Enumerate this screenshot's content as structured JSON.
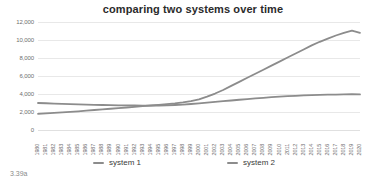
{
  "figure": {
    "caption": "3.39a"
  },
  "legend": {
    "position": "bottom",
    "items": [
      {
        "label": "system 1",
        "color": "#8c8c8c"
      },
      {
        "label": "system 2",
        "color": "#8c8c8c"
      }
    ]
  },
  "chart_data": {
    "type": "line",
    "title": "comparing two systems over time",
    "xlabel": "",
    "ylabel": "",
    "grid": true,
    "legend_position": "bottom",
    "ylim": [
      0,
      12000
    ],
    "yticks": [
      0,
      2000,
      4000,
      6000,
      8000,
      10000,
      12000
    ],
    "ytick_labels": [
      "0",
      "2,000",
      "4,000",
      "6,000",
      "8,000",
      "10,000",
      "12,000"
    ],
    "categories": [
      "1980",
      "1981",
      "1982",
      "1983",
      "1984",
      "1985",
      "1986",
      "1987",
      "1988",
      "1989",
      "1990",
      "1991",
      "1992",
      "1993",
      "1994",
      "1995",
      "1996",
      "1997",
      "1998",
      "1999",
      "2000",
      "2001",
      "2002",
      "2003",
      "2004",
      "2005",
      "2006",
      "2007",
      "2008",
      "2009",
      "2010",
      "2011",
      "2012",
      "2013",
      "2014",
      "2015",
      "2016",
      "2017",
      "2018",
      "2019",
      "2020"
    ],
    "series": [
      {
        "name": "system 1",
        "color": "#8c8c8c",
        "values": [
          1800,
          1850,
          1900,
          1960,
          2020,
          2080,
          2150,
          2220,
          2290,
          2360,
          2430,
          2500,
          2580,
          2650,
          2720,
          2800,
          2880,
          2960,
          3060,
          3200,
          3400,
          3700,
          4050,
          4450,
          4900,
          5350,
          5800,
          6250,
          6700,
          7150,
          7600,
          8050,
          8500,
          8950,
          9400,
          9800,
          10150,
          10500,
          10800,
          11050,
          10800
        ]
      },
      {
        "name": "system 2",
        "color": "#8c8c8c",
        "values": [
          3000,
          2970,
          2940,
          2910,
          2880,
          2850,
          2820,
          2800,
          2780,
          2760,
          2740,
          2730,
          2720,
          2715,
          2710,
          2720,
          2740,
          2780,
          2830,
          2890,
          2960,
          3040,
          3120,
          3200,
          3280,
          3360,
          3440,
          3510,
          3580,
          3650,
          3710,
          3760,
          3800,
          3840,
          3870,
          3900,
          3920,
          3940,
          3960,
          3990,
          3950
        ]
      }
    ]
  }
}
